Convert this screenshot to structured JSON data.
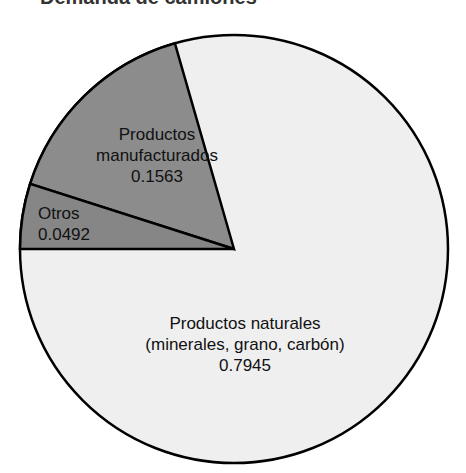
{
  "title": "Demanda de camiones",
  "colors": {
    "natural": "#efefef",
    "manufactured": "#8c8c8c",
    "other": "#868686",
    "outline": "#000000"
  },
  "labels": {
    "manufactured": {
      "line1": "Productos",
      "line2": "manufacturados",
      "value": "0.1563"
    },
    "other": {
      "line1": "Otros",
      "value": "0.0492"
    },
    "natural": {
      "line1": "Productos naturales",
      "line2": "(minerales, grano, carbón)",
      "value": "0.7945"
    }
  },
  "chart_data": {
    "type": "pie",
    "title": "Demanda de camiones",
    "categories": [
      "Productos naturales (minerales, grano, carbón)",
      "Productos manufacturados",
      "Otros"
    ],
    "values": [
      0.7945,
      0.1563,
      0.0492
    ],
    "data_labels_shown": true,
    "legend": "none"
  }
}
